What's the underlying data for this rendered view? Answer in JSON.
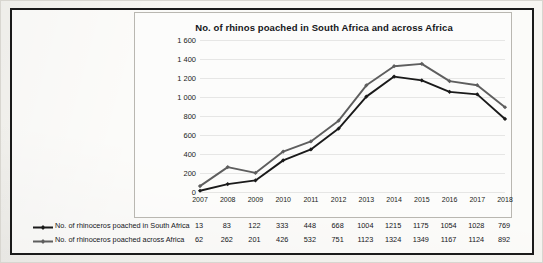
{
  "chart_data": {
    "type": "line",
    "title": "No. of rhinos poached in South Africa and across Africa",
    "xlabel": "",
    "ylabel": "",
    "grid": true,
    "legend_position": "bottom-left",
    "ylim": [
      0,
      1600
    ],
    "yticks": [
      0,
      200,
      400,
      600,
      800,
      1000,
      1200,
      1400,
      1600
    ],
    "ytick_labels": [
      "0",
      "200",
      "400",
      "600",
      "800",
      "1 000",
      "1 200",
      "1 400",
      "1 600"
    ],
    "categories": [
      "2007",
      "2008",
      "2009",
      "2010",
      "2011",
      "2012",
      "2013",
      "2014",
      "2015",
      "2016",
      "2017",
      "2018"
    ],
    "series": [
      {
        "name": "No. of rhinoceros  poached in South Africa",
        "color": "#1a1a1a",
        "marker": "diamond",
        "values": [
          13,
          83,
          122,
          333,
          448,
          668,
          1004,
          1215,
          1175,
          1054,
          1028,
          769
        ]
      },
      {
        "name": "No. of rhinoceros poached across Africa",
        "color": "#5e5e5e",
        "marker": "diamond",
        "values": [
          62,
          262,
          201,
          426,
          532,
          751,
          1123,
          1324,
          1349,
          1167,
          1124,
          892
        ]
      }
    ]
  }
}
